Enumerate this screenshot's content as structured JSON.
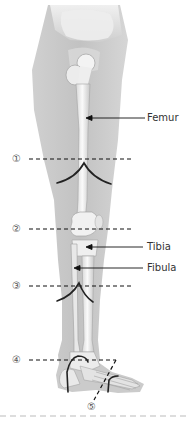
{
  "diagram": {
    "labels": {
      "femur": "Femur",
      "tibia": "Tibia",
      "fibula": "Fibula"
    },
    "markers": [
      {
        "id": 1,
        "glyph": "①"
      },
      {
        "id": 2,
        "glyph": "②"
      },
      {
        "id": 3,
        "glyph": "③"
      },
      {
        "id": 4,
        "glyph": "④"
      },
      {
        "id": 5,
        "glyph": "⑤"
      }
    ],
    "colors": {
      "skin": "#c8c8c8",
      "skin_light": "#e2e2e2",
      "bone": "#f2f2f2",
      "bone_shade": "#bdbdbd",
      "cut_line": "#222222",
      "dash_line": "#111111"
    }
  }
}
